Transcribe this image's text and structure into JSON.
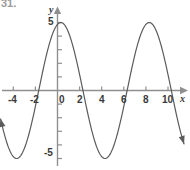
{
  "problem": {
    "number": "31."
  },
  "chart_data": {
    "type": "line",
    "title": "",
    "subtitle": "",
    "xlabel": "x",
    "ylabel": "y",
    "xlim": [
      -5.2,
      11.6
    ],
    "ylim": [
      -5.9,
      5.9
    ],
    "grid": false,
    "legend_position": "none",
    "x_ticks": [
      -4,
      -2,
      0,
      2,
      4,
      6,
      8,
      10
    ],
    "x_tick_labels": [
      "-4",
      "-2",
      "0",
      "2",
      "4",
      "6",
      "8",
      "10"
    ],
    "y_ticks": [
      -5,
      -4,
      -3,
      -2,
      -1,
      0,
      1,
      2,
      3,
      4,
      5
    ],
    "y_tick_labels_shown": {
      "5": "5",
      "0": "0",
      "-5": "-5"
    },
    "series": [
      {
        "name": "sinusoid",
        "equation": "y = 5 cos( (pi/4)(x - 0.3) )",
        "amplitude": 5,
        "period": 8,
        "phase_shift": 0.3,
        "midline": 0,
        "color": "#5b5b5b",
        "line_width": 1.2,
        "arrow_start": true,
        "arrow_end": true,
        "x_start": -5.15,
        "x_end": 11.45,
        "key_points": {
          "maxima": [
            [
              0.3,
              5
            ],
            [
              8.3,
              5
            ]
          ],
          "minima": [
            [
              -3.7,
              -5
            ],
            [
              4.3,
              -5
            ]
          ],
          "zeros": [
            -1.7,
            2.3,
            6.3,
            10.3
          ]
        },
        "points": [
          [
            -5.15,
            -3.0
          ],
          [
            -4.7,
            -4.3
          ],
          [
            -4.2,
            -4.9
          ],
          [
            -3.7,
            -5.0
          ],
          [
            -3.2,
            -4.8
          ],
          [
            -2.7,
            -4.0
          ],
          [
            -2.2,
            -2.7
          ],
          [
            -1.7,
            0.0
          ],
          [
            -1.2,
            1.9
          ],
          [
            -0.7,
            3.5
          ],
          [
            -0.2,
            4.6
          ],
          [
            0.3,
            5.0
          ],
          [
            0.8,
            4.9
          ],
          [
            1.3,
            4.2
          ],
          [
            1.8,
            2.9
          ],
          [
            2.3,
            0.0
          ],
          [
            2.8,
            -1.9
          ],
          [
            3.3,
            -3.5
          ],
          [
            3.8,
            -4.6
          ],
          [
            4.3,
            -5.0
          ],
          [
            4.8,
            -4.9
          ],
          [
            5.3,
            -4.2
          ],
          [
            5.8,
            -2.9
          ],
          [
            6.3,
            0.0
          ],
          [
            6.8,
            1.9
          ],
          [
            7.3,
            3.5
          ],
          [
            7.8,
            4.6
          ],
          [
            8.3,
            5.0
          ],
          [
            8.8,
            4.9
          ],
          [
            9.3,
            4.2
          ],
          [
            9.8,
            2.9
          ],
          [
            10.3,
            0.0
          ],
          [
            10.8,
            -2.2
          ],
          [
            11.45,
            -4.4
          ]
        ]
      }
    ],
    "axis_color": "#8f8f8f",
    "tick_color": "#8f8f8f",
    "label_color": "#3a3a3a"
  }
}
